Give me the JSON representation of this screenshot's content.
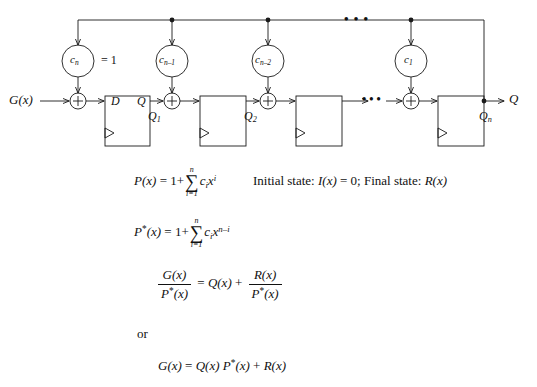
{
  "diagram": {
    "input_label": "G(x)",
    "output_label": "Q",
    "coefficients": [
      {
        "name": "c-sub-n",
        "base": "c",
        "sub": "n",
        "note": "= 1"
      },
      {
        "name": "c-sub-n-minus-1",
        "base": "c",
        "sub": "n–1",
        "note": ""
      },
      {
        "name": "c-sub-n-minus-2",
        "base": "c",
        "sub": "n–2",
        "note": ""
      },
      {
        "name": "c-sub-1",
        "base": "c",
        "sub": "1",
        "note": ""
      }
    ],
    "flipflops": [
      {
        "d_label": "D",
        "q_label": "Q",
        "out_label_base": "Q",
        "out_label_sub": "1"
      },
      {
        "d_label": "",
        "q_label": "",
        "out_label_base": "Q",
        "out_label_sub": "2"
      },
      {
        "d_label": "",
        "q_label": "",
        "out_label_base": "",
        "out_label_sub": ""
      },
      {
        "d_label": "",
        "q_label": "",
        "out_label_base": "Q",
        "out_label_sub": "n"
      }
    ],
    "adder_symbol": "+",
    "ellipsis": "• • •",
    "eq_one_label": "= 1",
    "colors": {
      "line": "#1a1a1a",
      "text": "#111111",
      "background": "#ffffff"
    }
  },
  "equations": {
    "p_of_x": {
      "name": "P(x) definition",
      "lhs_base": "P",
      "lhs_arg": "(x)",
      "eq": "=",
      "one_plus": "1+",
      "sum_top": "n",
      "sum_sym": "∑",
      "sum_bottom": "i=1",
      "term_c": "c",
      "term_c_sub": "i",
      "term_x": "x",
      "term_x_sup": "i"
    },
    "states": {
      "name": "initial and final state note",
      "initial_prefix": "Initial state: ",
      "initial_expr": "I(x)",
      "initial_eq": " = 0; ",
      "final_prefix": "Final state: ",
      "final_expr": "R(x)"
    },
    "p_star_of_x": {
      "name": "P*(x) definition",
      "lhs_base": "P",
      "lhs_star": "*",
      "lhs_arg": "(x)",
      "eq": "=",
      "one_plus": "1+",
      "sum_top": "n",
      "sum_sym": "∑",
      "sum_bottom": "i=1",
      "term_c": "c",
      "term_c_sub": "i",
      "term_x": "x",
      "term_x_sup": "n–i"
    },
    "division": {
      "name": "division identity",
      "num1": "G(x)",
      "den1_base": "P",
      "den1_star": "*",
      "den1_arg": "(x)",
      "eq": "=",
      "q_term": "Q(x)",
      "plus": "+",
      "num2": "R(x)",
      "den2_base": "P",
      "den2_star": "*",
      "den2_arg": "(x)"
    },
    "or_text": "or",
    "product": {
      "name": "product form identity",
      "lhs": "G(x)",
      "eq": "=",
      "q": "Q(x)",
      "p_base": "P",
      "p_star": "*",
      "p_arg": "(x)",
      "plus": "+",
      "r": "R(x)"
    }
  }
}
